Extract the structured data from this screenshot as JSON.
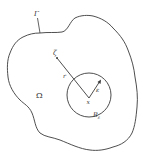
{
  "diagram": {
    "boundary_label": "Γ",
    "domain_label": "Ω",
    "point_zeta_label": "ζ",
    "radius_r_label": "r",
    "epsilon_label": "ε",
    "center_x_label": "x",
    "ball_label_base": "B",
    "ball_label_sub": "ε",
    "colors": {
      "stroke": "#3a3a3a",
      "background": "#ffffff"
    }
  }
}
